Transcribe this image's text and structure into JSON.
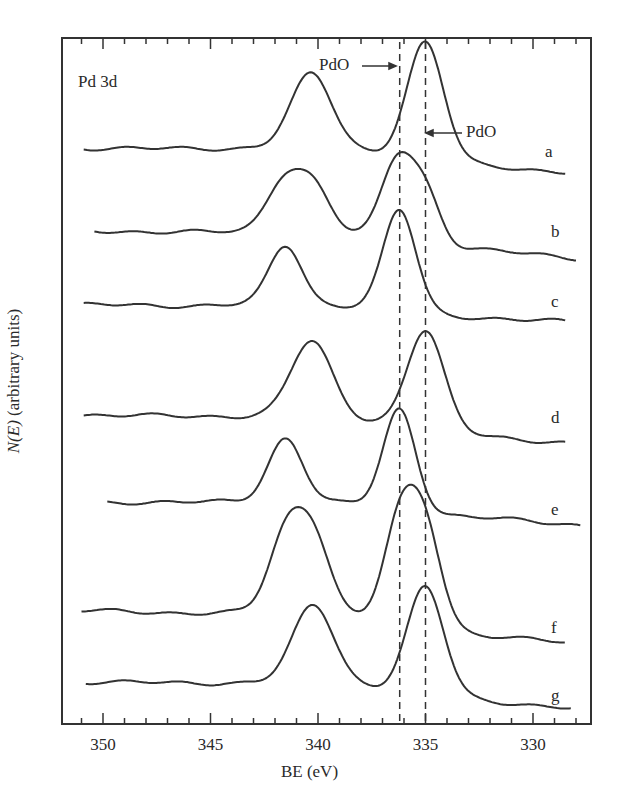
{
  "chart_data": {
    "type": "line",
    "title": "Pd 3d",
    "xlabel": "BE (eV)",
    "ylabel": "N(E) (arbitrary units)",
    "x_reversed": true,
    "xlim": [
      351.5,
      327.5
    ],
    "xticks_major": [
      350,
      345,
      340,
      335,
      330
    ],
    "xtick_labels": [
      "350",
      "345",
      "340",
      "335",
      "330"
    ],
    "xticks_minor_step": 1,
    "grid": false,
    "legend": "none (traces labeled a–g at right)",
    "reference_lines": [
      {
        "x": 336.2,
        "style": "dashed",
        "label": "PdO",
        "arrow": "from left"
      },
      {
        "x": 335.0,
        "style": "dashed",
        "label": "PdO",
        "arrow": "from right"
      }
    ],
    "series": [
      {
        "name": "a",
        "offset_rank": 1,
        "peaks": [
          {
            "be": 340.3,
            "height": 0.63
          },
          {
            "be": 335.0,
            "height": 1.0
          }
        ],
        "baseline_left": 0.0,
        "baseline_right": -0.05
      },
      {
        "name": "b",
        "offset_rank": 2,
        "peaks": [
          {
            "be": 341.6,
            "height": 0.55
          },
          {
            "be": 340.2,
            "height": 0.5
          },
          {
            "be": 336.3,
            "height": 0.88
          },
          {
            "be": 335.0,
            "height": 0.55
          }
        ],
        "baseline_left": 0.0,
        "baseline_right": -0.05
      },
      {
        "name": "c",
        "offset_rank": 3,
        "peaks": [
          {
            "be": 341.5,
            "height": 0.58
          },
          {
            "be": 336.2,
            "height": 1.0
          }
        ],
        "baseline_left": 0.0,
        "baseline_right": -0.05
      },
      {
        "name": "d",
        "offset_rank": 4,
        "peaks": [
          {
            "be": 340.3,
            "height": 0.7
          },
          {
            "be": 335.0,
            "height": 0.92
          }
        ],
        "baseline_left": 0.0,
        "baseline_right": -0.05
      },
      {
        "name": "e",
        "offset_rank": 5,
        "peaks": [
          {
            "be": 341.5,
            "height": 0.6
          },
          {
            "be": 336.2,
            "height": 0.95
          }
        ],
        "baseline_left": 0.0,
        "baseline_right": -0.05
      },
      {
        "name": "f",
        "offset_rank": 6,
        "peaks": [
          {
            "be": 341.5,
            "height": 0.67
          },
          {
            "be": 340.2,
            "height": 0.68
          },
          {
            "be": 336.2,
            "height": 0.88
          },
          {
            "be": 335.0,
            "height": 0.86
          }
        ],
        "baseline_left": 0.0,
        "baseline_right": -0.05
      },
      {
        "name": "g",
        "offset_rank": 7,
        "peaks": [
          {
            "be": 340.2,
            "height": 0.72
          },
          {
            "be": 335.0,
            "height": 1.0
          }
        ],
        "baseline_left": 0.0,
        "baseline_right": -0.05
      }
    ]
  },
  "labels": {
    "title": "Pd 3d",
    "xlabel": "BE (eV)",
    "ylabel_italic": "N(E)",
    "ylabel_rest": " (arbitrary units)",
    "pdo_left": "PdO",
    "pdo_right": "PdO",
    "trace_labels": [
      "a",
      "b",
      "c",
      "d",
      "e",
      "f",
      "g"
    ],
    "ticks": [
      "350",
      "345",
      "340",
      "335",
      "330"
    ]
  }
}
